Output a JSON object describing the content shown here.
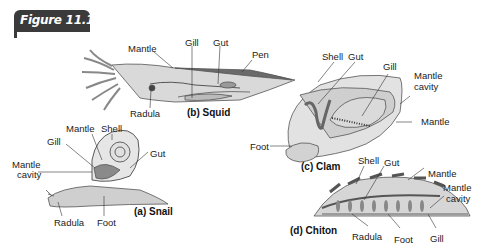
{
  "figure": {
    "title": "Figure 11.10",
    "header_color": "#3a3a3a"
  },
  "panels": {
    "snail": {
      "caption": "(a) Snail",
      "labels": {
        "mantle": "Mantle",
        "shell": "Shell",
        "gill": "Gill",
        "gut": "Gut",
        "mantle_cavity_1": "Mantle",
        "mantle_cavity_2": "cavity",
        "radula": "Radula",
        "foot": "Foot"
      }
    },
    "squid": {
      "caption": "(b) Squid",
      "labels": {
        "mantle": "Mantle",
        "gill": "Gill",
        "gut": "Gut",
        "pen": "Pen",
        "radula": "Radula"
      }
    },
    "clam": {
      "caption": "(c) Clam",
      "labels": {
        "shell": "Shell",
        "gut": "Gut",
        "gill": "Gill",
        "mantle_cavity_1": "Mantle",
        "mantle_cavity_2": "cavity",
        "mantle": "Mantle",
        "foot": "Foot"
      }
    },
    "chiton": {
      "caption": "(d) Chiton",
      "labels": {
        "shell": "Shell",
        "gut": "Gut",
        "mantle": "Mantle",
        "mantle_cavity_1": "Mantle",
        "mantle_cavity_2": "cavity",
        "radula": "Radula",
        "foot": "Foot",
        "gill": "Gill"
      }
    }
  }
}
